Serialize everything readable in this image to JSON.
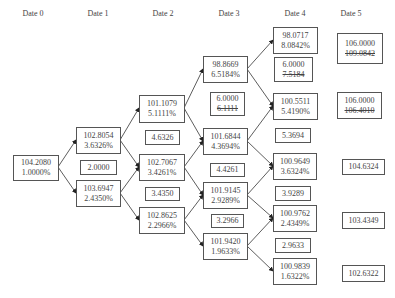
{
  "headers": [
    "Date 0",
    "Date 1",
    "Date 2",
    "Date 3",
    "Date 4",
    "Date 5"
  ],
  "nodes": {
    "d0_0": {
      "price": "104.2080",
      "rate": "1.0000%"
    },
    "d1_0": {
      "price": "102.8054",
      "rate": "3.6326%"
    },
    "d1_1": {
      "price": "103.6947",
      "rate": "2.4350%"
    },
    "d2_0": {
      "price": "101.1079",
      "rate": "5.1111%"
    },
    "d2_1": {
      "price": "102.7067",
      "rate": "3.4261%"
    },
    "d2_2": {
      "price": "102.8625",
      "rate": "2.2966%"
    },
    "d3_0": {
      "price": "98.8669",
      "rate": "6.5184%"
    },
    "d3_1": {
      "price": "101.6844",
      "rate": "4.3694%"
    },
    "d3_2": {
      "price": "101.9145",
      "rate": "2.9289%"
    },
    "d3_3": {
      "price": "101.9420",
      "rate": "1.9633%"
    },
    "d4_0": {
      "price": "98.0717",
      "rate": "8.0842%"
    },
    "d4_1": {
      "price": "100.5511",
      "rate": "5.4190%"
    },
    "d4_2": {
      "price": "100.9649",
      "rate": "3.6324%"
    },
    "d4_3": {
      "price": "100.9762",
      "rate": "2.4349%"
    },
    "d4_4": {
      "price": "100.9839",
      "rate": "1.6322%"
    }
  },
  "mid_values": {
    "d1": "2.0000",
    "d2_a": "4.6326",
    "d2_b": "3.4350",
    "d3_a": {
      "value": "6.0000",
      "struck": "6.1111"
    },
    "d3_b": "4.4261",
    "d3_c": "3.2966",
    "d4_a": {
      "value": "6.0000",
      "struck": "7.5184"
    },
    "d4_b": "5.3694",
    "d4_c": "3.9289",
    "d4_d": "2.9633"
  },
  "date5": {
    "n0": {
      "value": "106.0000",
      "struck": "109.0842"
    },
    "n1": {
      "value": "106.0000",
      "struck": "106.4010"
    },
    "n2": "104.6324",
    "n3": "103.4349",
    "n4": "102.6322"
  }
}
